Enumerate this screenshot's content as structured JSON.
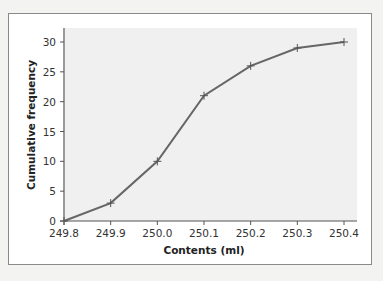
{
  "chart_data": {
    "type": "line",
    "title": "",
    "xlabel": "Contents (ml)",
    "ylabel": "Cumulative frequency",
    "x": [
      249.8,
      249.9,
      250.0,
      250.1,
      250.2,
      250.3,
      250.4
    ],
    "values": [
      0,
      3,
      10,
      21,
      26,
      29,
      30
    ],
    "x_ticks": [
      "249.8",
      "249.9",
      "250.0",
      "250.1",
      "250.2",
      "250.3",
      "250.4"
    ],
    "y_ticks": [
      "0",
      "5",
      "10",
      "15",
      "20",
      "25",
      "30"
    ],
    "xlim": [
      249.8,
      250.4
    ],
    "ylim": [
      0,
      31
    ],
    "grid": false,
    "legend": null,
    "marker": "plus",
    "colors": {
      "line": "#666666",
      "plot_bg": "#f0f0f0",
      "frame_bg": "#ffffff",
      "page_bg": "#f3f3f2"
    }
  }
}
